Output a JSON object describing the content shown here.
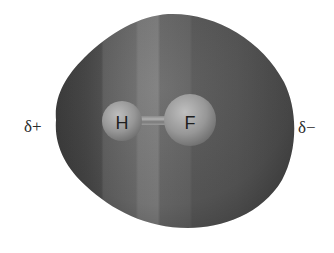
{
  "figure": {
    "molecule": "HF",
    "atoms": [
      {
        "symbol": "H",
        "label": "H"
      },
      {
        "symbol": "F",
        "label": "F"
      }
    ],
    "bond": "H–F",
    "charges": {
      "positive_label": "δ+",
      "negative_label": "δ−"
    },
    "colors": {
      "background": "#ffffff",
      "surface_dark": "#3e3e3e",
      "surface_mid": "#5a5a5a",
      "surface_light": "#7a7a7a",
      "atom_fill": "#9a9a9a",
      "text": "#2a2a2a"
    }
  }
}
